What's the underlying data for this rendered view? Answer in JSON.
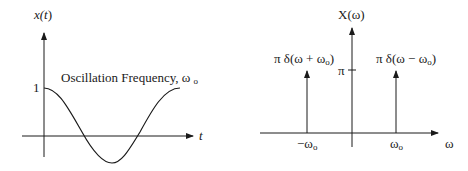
{
  "time_plot": {
    "y_axis_label_prefix": "x(",
    "y_axis_label_var": "t",
    "y_axis_label_suffix": ")",
    "x_axis_label": "t",
    "y_tick_label": "1",
    "annotation_text": "Oscillation Frequency, ω",
    "annotation_sub": "o",
    "signal": "cos(ω₀t)"
  },
  "freq_plot": {
    "y_axis_label": "X(ω)",
    "x_axis_label": "ω",
    "y_tick_label": "π",
    "impulse_left_label": "π δ(ω + ω",
    "impulse_left_sub": "o",
    "impulse_left_close": ")",
    "impulse_right_label": "π δ(ω − ω",
    "impulse_right_sub": "o",
    "impulse_right_close": ")",
    "tick_left_label": "−ω",
    "tick_left_sub": "o",
    "tick_right_label": "ω",
    "tick_right_sub": "o"
  },
  "colors": {
    "ink": "#1a1a1a",
    "background": "#ffffff"
  }
}
